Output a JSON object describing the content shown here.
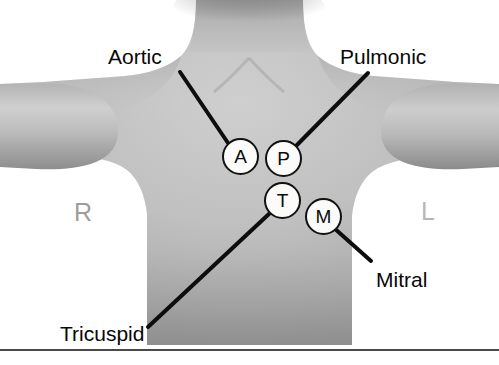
{
  "figure": {
    "background_color": "#ffffff",
    "width": 499,
    "height": 365
  },
  "anatomy": {
    "subject": "human-torso-anterior",
    "description": "Grayscale photograph silhouette of a neck, shoulders, arms and upper chest",
    "skin_light": "#c9c9c9",
    "skin_mid": "#aeaeae",
    "skin_shadow": "#8f8f8f",
    "skin_deep_shadow": "#767676"
  },
  "auscultation_points": [
    {
      "letter": "A",
      "name": "aortic",
      "label": "Aortic",
      "cx": 240,
      "cy": 156,
      "r": 18
    },
    {
      "letter": "P",
      "name": "pulmonic",
      "label": "Pulmonic",
      "cx": 283,
      "cy": 158,
      "r": 18
    },
    {
      "letter": "T",
      "name": "tricuspid",
      "label": "Tricuspid",
      "cx": 282,
      "cy": 200,
      "r": 18
    },
    {
      "letter": "M",
      "name": "mitral",
      "label": "Mitral",
      "cx": 323,
      "cy": 216,
      "r": 18
    }
  ],
  "callouts": [
    {
      "id": "aortic",
      "text": "Aortic",
      "text_x": 108,
      "text_y": 46,
      "line_x1": 180,
      "line_y1": 72,
      "line_x2": 228,
      "line_y2": 143
    },
    {
      "id": "pulmonic",
      "text": "Pulmonic",
      "text_x": 340,
      "text_y": 46,
      "line_x1": 368,
      "line_y1": 73,
      "line_x2": 295,
      "line_y2": 147
    },
    {
      "id": "tricuspid",
      "text": "Tricuspid",
      "text_x": 60,
      "text_y": 323,
      "line_x1": 148,
      "line_y1": 327,
      "line_x2": 270,
      "line_y2": 213
    },
    {
      "id": "mitral",
      "text": "Mitral",
      "text_x": 376,
      "text_y": 269,
      "line_x1": 371,
      "line_y1": 261,
      "line_x2": 334,
      "line_y2": 228
    }
  ],
  "side_markers": [
    {
      "id": "right",
      "text": "R",
      "x": 74,
      "y": 200,
      "color": "#9d9d9d"
    },
    {
      "id": "left",
      "text": "L",
      "x": 421,
      "y": 199,
      "color": "#b6b6b6"
    }
  ],
  "line_style": {
    "color": "#0d0d0d",
    "width": 4
  },
  "baseline": {
    "color": "#4a4a4a",
    "y": 349
  }
}
